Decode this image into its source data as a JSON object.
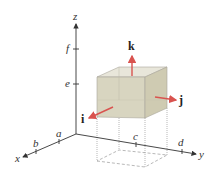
{
  "diagram": {
    "axes": {
      "x": "x",
      "y": "y",
      "z": "z"
    },
    "ticks": {
      "x": [
        "a",
        "b"
      ],
      "y": [
        "c",
        "d"
      ],
      "z": [
        "e",
        "f"
      ]
    },
    "unit_vectors": {
      "i": "i",
      "j": "j",
      "k": "k"
    },
    "colors": {
      "box_front": "#d8d5c0",
      "box_top": "#e8e6da",
      "box_side": "#cfcbb2",
      "arrow": "#d9534f",
      "axis": "#333333"
    }
  }
}
